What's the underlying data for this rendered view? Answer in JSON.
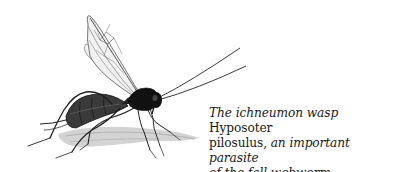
{
  "figure": {
    "illustration": {
      "subject": "ichneumon wasp",
      "colors": {
        "body": "#111111",
        "abdomen": "#2a2a2a",
        "wing_vein": "#555555",
        "wing_fill": "#f2f2f2",
        "shadow": "#b8b8b8",
        "legs": "#222222"
      }
    },
    "caption": {
      "line1_italic": "The ichneumon wasp",
      "line1_roman": " Hyposoter",
      "line2_roman": "pilosulus,",
      "line2_italic": " an important parasite",
      "line3_italic": "of the fall webworm."
    }
  }
}
